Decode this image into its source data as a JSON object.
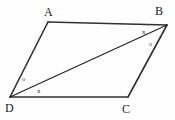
{
  "figure": {
    "background_color": "#fefefe",
    "stroke_color": "#303030",
    "diagonal_color": "#1f1f1f",
    "label_color": "#1a1a1a",
    "side_stroke_width": 1.6,
    "diagonal_stroke_width": 1.1,
    "width": 175,
    "height": 120
  },
  "vertices": [
    {
      "name": "A",
      "label": "A",
      "x": 48,
      "y": 22,
      "label_x": 44,
      "label_y": 6
    },
    {
      "name": "B",
      "label": "B",
      "x": 167,
      "y": 25,
      "label_x": 155,
      "label_y": 5
    },
    {
      "name": "C",
      "label": "C",
      "x": 128,
      "y": 97,
      "label_x": 122,
      "label_y": 103
    },
    {
      "name": "D",
      "label": "D",
      "x": 10,
      "y": 97,
      "label_x": 5,
      "label_y": 102
    }
  ],
  "edges": [
    {
      "name": "side-AB",
      "from": "A",
      "to": "B",
      "kind": "side"
    },
    {
      "name": "side-BC",
      "from": "B",
      "to": "C",
      "kind": "side"
    },
    {
      "name": "side-CD",
      "from": "C",
      "to": "D",
      "kind": "side"
    },
    {
      "name": "side-DA",
      "from": "D",
      "to": "A",
      "kind": "side"
    },
    {
      "name": "diagonal-DB",
      "from": "D",
      "to": "B",
      "kind": "diagonal"
    }
  ],
  "angle_marks": [
    {
      "name": "angle-ADB",
      "symbol": "o",
      "vertex": "D",
      "x": 22,
      "y": 76,
      "between": "DA and DB"
    },
    {
      "name": "angle-BDC",
      "symbol": "x",
      "vertex": "D",
      "x": 37,
      "y": 88,
      "between": "DB and DC"
    },
    {
      "name": "angle-ABD",
      "symbol": "x",
      "vertex": "B",
      "x": 142,
      "y": 29,
      "between": "BA and BD"
    },
    {
      "name": "angle-DBC",
      "symbol": "o",
      "vertex": "B",
      "x": 149,
      "y": 41,
      "between": "BD and BC"
    }
  ]
}
